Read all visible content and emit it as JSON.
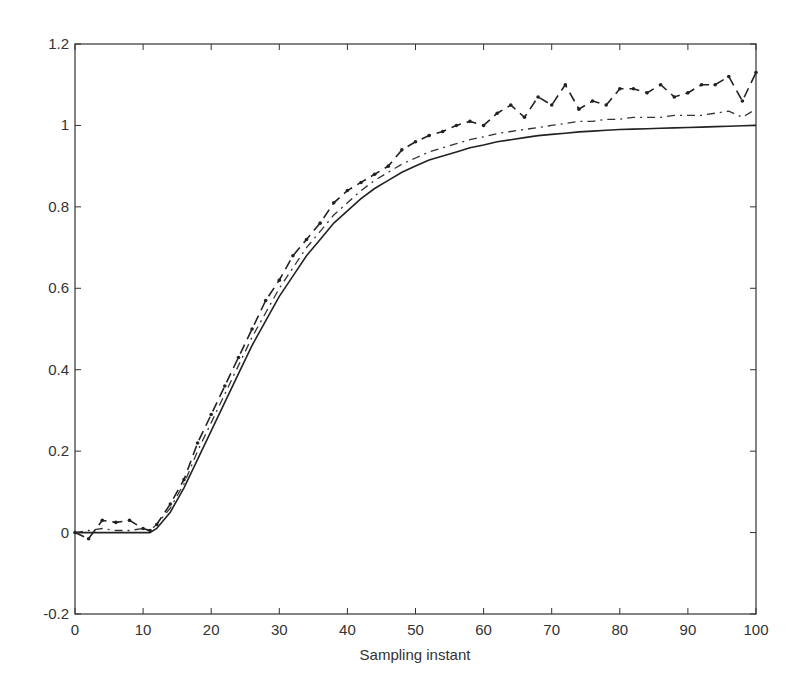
{
  "chart_data": {
    "type": "line",
    "title": "",
    "xlabel": "Sampling instant",
    "ylabel": "",
    "xlim": [
      0,
      100
    ],
    "ylim": [
      -0.2,
      1.2
    ],
    "grid": false,
    "legend": null,
    "x_ticks": [
      "0",
      "10",
      "20",
      "30",
      "40",
      "50",
      "60",
      "70",
      "80",
      "90",
      "100"
    ],
    "y_ticks": [
      "-0.2",
      "0",
      "0.2",
      "0.4",
      "0.6",
      "0.8",
      "1",
      "1.2"
    ],
    "x": [
      0,
      2,
      4,
      6,
      8,
      10,
      11,
      12,
      14,
      16,
      18,
      20,
      22,
      24,
      26,
      28,
      30,
      32,
      34,
      36,
      38,
      40,
      42,
      44,
      46,
      48,
      50,
      52,
      54,
      56,
      58,
      60,
      62,
      64,
      66,
      68,
      70,
      72,
      74,
      76,
      78,
      80,
      82,
      84,
      86,
      88,
      90,
      92,
      94,
      96,
      98,
      100
    ],
    "series": [
      {
        "name": "solid",
        "style": "solid",
        "values": [
          0,
          0,
          0,
          0,
          0,
          0,
          0,
          0.01,
          0.05,
          0.11,
          0.18,
          0.25,
          0.32,
          0.39,
          0.46,
          0.52,
          0.58,
          0.63,
          0.68,
          0.72,
          0.76,
          0.79,
          0.82,
          0.845,
          0.865,
          0.885,
          0.9,
          0.915,
          0.925,
          0.935,
          0.945,
          0.952,
          0.96,
          0.965,
          0.97,
          0.975,
          0.978,
          0.981,
          0.984,
          0.986,
          0.988,
          0.99,
          0.991,
          0.992,
          0.993,
          0.994,
          0.995,
          0.996,
          0.997,
          0.998,
          0.999,
          1.0
        ]
      },
      {
        "name": "dash-dot",
        "style": "dashdot",
        "values": [
          0,
          0.005,
          0.01,
          0.005,
          0.005,
          0.01,
          0.005,
          0.02,
          0.06,
          0.12,
          0.2,
          0.27,
          0.34,
          0.41,
          0.48,
          0.54,
          0.6,
          0.65,
          0.7,
          0.74,
          0.78,
          0.81,
          0.84,
          0.865,
          0.885,
          0.905,
          0.92,
          0.935,
          0.945,
          0.955,
          0.965,
          0.972,
          0.98,
          0.985,
          0.99,
          0.995,
          1.0,
          1.005,
          1.01,
          1.01,
          1.015,
          1.015,
          1.02,
          1.02,
          1.02,
          1.025,
          1.025,
          1.025,
          1.03,
          1.035,
          1.02,
          1.04
        ]
      },
      {
        "name": "dotted-markers",
        "style": "dotted",
        "values": [
          0.0,
          -0.015,
          0.03,
          0.025,
          0.03,
          0.01,
          0.005,
          0.02,
          0.07,
          0.13,
          0.22,
          0.29,
          0.36,
          0.43,
          0.5,
          0.57,
          0.62,
          0.68,
          0.72,
          0.76,
          0.81,
          0.84,
          0.86,
          0.88,
          0.9,
          0.94,
          0.96,
          0.975,
          0.985,
          1.0,
          1.01,
          1.0,
          1.03,
          1.05,
          1.02,
          1.07,
          1.05,
          1.1,
          1.04,
          1.06,
          1.05,
          1.09,
          1.09,
          1.08,
          1.1,
          1.07,
          1.08,
          1.1,
          1.1,
          1.12,
          1.06,
          1.13
        ]
      }
    ]
  },
  "plot_frame": {
    "left": 75,
    "right": 756,
    "top": 44,
    "bottom": 614
  }
}
